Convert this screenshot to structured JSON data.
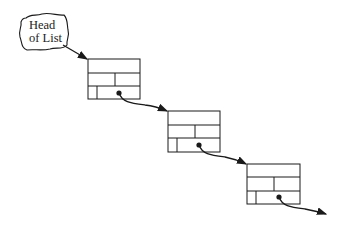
{
  "diagram": {
    "type": "linked-list",
    "head_label": {
      "line1": "Head",
      "line2": "of List"
    },
    "nodes": [
      {
        "id": "node-1",
        "x": 88,
        "y": 59,
        "dot": [
          119,
          94
        ]
      },
      {
        "id": "node-2",
        "x": 168,
        "y": 111,
        "dot": [
          199,
          146
        ]
      },
      {
        "id": "node-3",
        "x": 247,
        "y": 164,
        "dot": [
          279,
          198
        ]
      }
    ],
    "colors": {
      "stroke": "#1a1a1a",
      "background": "#ffffff"
    }
  }
}
